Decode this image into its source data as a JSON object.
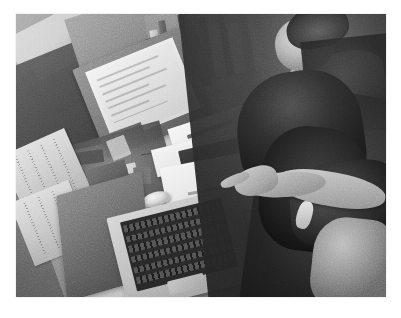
{
  "image": {
    "kind": "photograph",
    "medium": "black-and-white grainy halftone print",
    "orientation": "landscape",
    "framing": "white print border around image",
    "viewpoint": "high angle looking down over a desk",
    "scene": "two people working together at a cluttered office cubicle desk",
    "palette": {
      "paper_white": "#ffffff",
      "highlight": "#f4f3ef",
      "light_gray": "#cfcec9",
      "mid_gray": "#8e8d88",
      "dark_gray": "#4a4944",
      "shadow_black": "#1a1913"
    },
    "border": {
      "left": 16,
      "top": 14,
      "width": 370,
      "height": 283
    }
  },
  "subjects": [
    {
      "id": "person-seated",
      "label": "Seated person at top right",
      "description": "Face visible in profile, light top, leaning toward the screen"
    },
    {
      "id": "person-foreground",
      "label": "Person with long dark hair in foreground",
      "description": "Dark long hair, dark top, arm extended reaching toward the desk"
    }
  ],
  "objects": [
    {
      "id": "cubicle-panels",
      "label": "Cubicle wall panels"
    },
    {
      "id": "bookshelf",
      "label": "Shelf of books and binders"
    },
    {
      "id": "monitor",
      "label": "Desktop monitor with bright screen"
    },
    {
      "id": "second-monitor",
      "label": "Second dark monitor"
    },
    {
      "id": "laptop",
      "label": "Silver laptop with dark keyboard"
    },
    {
      "id": "mouse",
      "label": "White computer mouse"
    },
    {
      "id": "desk-papers",
      "label": "White papers and documents on desk"
    },
    {
      "id": "pen",
      "label": "Pen resting on paper"
    },
    {
      "id": "notebook",
      "label": "Dark notebook on desk"
    },
    {
      "id": "desk-clutter",
      "label": "Assorted desk clutter, cables and small items"
    },
    {
      "id": "newspapers",
      "label": "Newspaper pages pinned on wall"
    },
    {
      "id": "pinned-photo",
      "label": "Pinned photograph of a face"
    },
    {
      "id": "reaching-arm",
      "label": "Arm and pointing hand with bracelet"
    }
  ],
  "screen": {
    "monitor_content": "bright washed-out window, illegible text rows"
  },
  "laptop": {
    "keyboard_rows": 6
  }
}
